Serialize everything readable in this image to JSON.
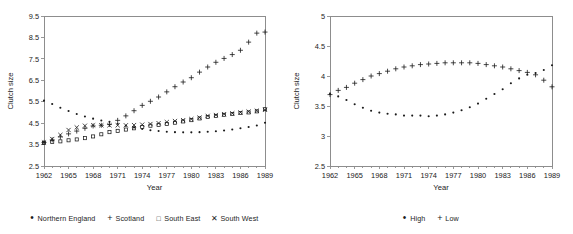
{
  "figure": {
    "background_color": "#ffffff",
    "ink_color": "#1a1a1a",
    "axis_color": "#8d8d8d"
  },
  "panels": [
    {
      "id": "left",
      "legend_marks": [
        "dot",
        "plus",
        "square",
        "cross"
      ]
    },
    {
      "id": "right",
      "legend_marks": [
        "dot",
        "plus"
      ]
    }
  ],
  "chart_data": [
    {
      "type": "scatter",
      "title": "",
      "xlabel": "Year",
      "ylabel": "Clutch size",
      "xlim": [
        1962,
        1989
      ],
      "ylim": [
        2.5,
        9.5
      ],
      "xticks": [
        1962,
        1965,
        1968,
        1971,
        1974,
        1977,
        1980,
        1983,
        1986,
        1989
      ],
      "xticklabels": [
        "1962",
        "1965",
        "1968",
        "1971",
        "1974",
        "1977",
        "1980",
        "1983",
        "1986",
        "1989"
      ],
      "yticks": [
        2.5,
        3.5,
        4.5,
        5.5,
        6.5,
        7.5,
        8.5,
        9.5
      ],
      "yticklabels": [
        "2.5",
        "3.5",
        "4.5",
        "5.5",
        "6.5",
        "7.5",
        "8.5",
        "9.5"
      ],
      "grid": false,
      "legend_position": "below",
      "x": [
        1962,
        1963,
        1964,
        1965,
        1966,
        1967,
        1968,
        1969,
        1970,
        1971,
        1972,
        1973,
        1974,
        1975,
        1976,
        1977,
        1978,
        1979,
        1980,
        1981,
        1982,
        1983,
        1984,
        1985,
        1986,
        1987,
        1988,
        1989
      ],
      "series": [
        {
          "name": "Northern England",
          "marker": "dot",
          "values": [
            5.55,
            5.39,
            5.22,
            5.07,
            4.93,
            4.81,
            4.71,
            4.62,
            4.56,
            4.47,
            4.38,
            4.3,
            4.23,
            4.17,
            4.13,
            4.1,
            4.08,
            4.07,
            4.07,
            4.08,
            4.1,
            4.12,
            4.16,
            4.2,
            4.26,
            4.32,
            4.39,
            4.52
          ]
        },
        {
          "name": "Scotland",
          "marker": "plus",
          "values": [
            3.6,
            3.72,
            3.86,
            4.0,
            4.13,
            4.26,
            4.37,
            4.4,
            4.44,
            4.63,
            4.84,
            5.08,
            5.33,
            5.52,
            5.72,
            5.96,
            6.2,
            6.42,
            6.62,
            6.88,
            7.12,
            7.34,
            7.52,
            7.7,
            7.9,
            8.28,
            8.7,
            8.75
          ]
        },
        {
          "name": "South East",
          "marker": "square",
          "values": [
            3.57,
            3.62,
            3.65,
            3.7,
            3.74,
            3.8,
            3.88,
            3.98,
            4.08,
            4.14,
            4.2,
            4.26,
            4.32,
            4.38,
            4.42,
            4.46,
            4.52,
            4.58,
            4.64,
            4.72,
            4.79,
            4.84,
            4.89,
            4.93,
            4.97,
            5.0,
            5.05,
            5.15
          ]
        },
        {
          "name": "South West",
          "marker": "cross",
          "values": [
            3.6,
            3.76,
            3.95,
            4.18,
            4.3,
            4.38,
            4.4,
            4.4,
            4.4,
            4.4,
            4.4,
            4.41,
            4.43,
            4.46,
            4.5,
            4.55,
            4.6,
            4.64,
            4.69,
            4.76,
            4.84,
            4.88,
            4.92,
            4.96,
            5.0,
            5.04,
            5.08,
            5.12
          ]
        }
      ]
    },
    {
      "type": "scatter",
      "title": "",
      "xlabel": "Year",
      "ylabel": "Clutch size",
      "xlim": [
        1962,
        1989
      ],
      "ylim": [
        2.5,
        5.0
      ],
      "xticks": [
        1962,
        1965,
        1968,
        1971,
        1974,
        1977,
        1980,
        1983,
        1986,
        1989
      ],
      "xticklabels": [
        "1962",
        "1965",
        "1968",
        "1971",
        "1974",
        "1977",
        "1980",
        "1983",
        "1986",
        "1989"
      ],
      "yticks": [
        2.5,
        3.0,
        3.5,
        4.0,
        4.5,
        5.0
      ],
      "yticklabels": [
        "2.5",
        "3",
        "3.5",
        "4",
        "4.5",
        "5"
      ],
      "grid": false,
      "legend_position": "below",
      "x": [
        1962,
        1963,
        1964,
        1965,
        1966,
        1967,
        1968,
        1969,
        1970,
        1971,
        1972,
        1973,
        1974,
        1975,
        1976,
        1977,
        1978,
        1979,
        1980,
        1981,
        1982,
        1983,
        1984,
        1985,
        1986,
        1987,
        1988,
        1989
      ],
      "series": [
        {
          "name": "High",
          "marker": "dot",
          "values": [
            3.7,
            3.66,
            3.6,
            3.53,
            3.47,
            3.42,
            3.39,
            3.37,
            3.36,
            3.34,
            3.34,
            3.34,
            3.33,
            3.34,
            3.36,
            3.39,
            3.43,
            3.48,
            3.54,
            3.62,
            3.7,
            3.78,
            3.88,
            3.96,
            4.02,
            4.05,
            4.1,
            4.18
          ]
        },
        {
          "name": "Low",
          "marker": "plus",
          "values": [
            3.69,
            3.76,
            3.81,
            3.88,
            3.94,
            4.0,
            4.04,
            4.08,
            4.12,
            4.15,
            4.17,
            4.19,
            4.2,
            4.21,
            4.22,
            4.22,
            4.22,
            4.22,
            4.21,
            4.19,
            4.17,
            4.15,
            4.12,
            4.09,
            4.06,
            4.02,
            3.93,
            3.82
          ]
        }
      ]
    }
  ]
}
